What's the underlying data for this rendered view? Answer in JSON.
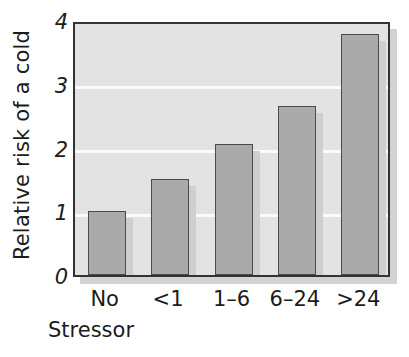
{
  "chart_data": {
    "type": "bar",
    "title": "",
    "subtitle": "",
    "xlabel": "Stressor",
    "ylabel": "Relative risk of a cold",
    "categories": [
      "No",
      "<1",
      "1–6",
      "6–24",
      ">24"
    ],
    "values": [
      1.0,
      1.5,
      2.05,
      2.65,
      3.78
    ],
    "series": [
      {
        "name": "Relative risk of a cold",
        "values": [
          1.0,
          1.5,
          2.05,
          2.65,
          3.78
        ]
      }
    ],
    "ylim": [
      0,
      4
    ],
    "xlim_note": "categorical",
    "yticks": [
      0,
      1,
      2,
      3,
      4
    ],
    "ytick_labels": [
      "0",
      "1",
      "2",
      "3",
      "4"
    ],
    "xtick_labels": [
      "No",
      "<1",
      "1–6",
      "6–24",
      ">24"
    ],
    "grid": "horizontal-white-gridlines",
    "legend": "none",
    "legend_position": "none",
    "annotations": [],
    "colors": {
      "bar_fill": "#aaaaaa",
      "bar_edge": "#4a4a4a",
      "plot_background": "#e3e3e3",
      "gridline": "#fbfbfb",
      "axis_frame": "#333333",
      "drop_shadow": "#d2d2d2",
      "text": "#1c1c1c",
      "page_background": "#ffffff"
    }
  }
}
